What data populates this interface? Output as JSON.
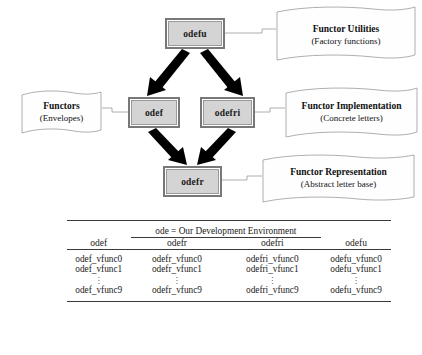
{
  "diagram": {
    "nodes": [
      {
        "id": "odefu",
        "label": "odefu"
      },
      {
        "id": "odef",
        "label": "odef"
      },
      {
        "id": "odefri",
        "label": "odefri"
      },
      {
        "id": "odefr",
        "label": "odefr"
      }
    ],
    "edges": [
      {
        "from": "odefu",
        "to": "odef",
        "style": "thick-arrow"
      },
      {
        "from": "odefu",
        "to": "odefri",
        "style": "thick-arrow"
      },
      {
        "from": "odef",
        "to": "odefr",
        "style": "thick-arrow"
      },
      {
        "from": "odefri",
        "to": "odefr",
        "style": "thick-arrow"
      }
    ],
    "notes": [
      {
        "id": "note-utilities",
        "title": "Functor Utilities",
        "subtitle": "(Factory functions)",
        "attached_to": "odefu"
      },
      {
        "id": "note-functors",
        "title": "Functors",
        "subtitle": "(Envelopes)",
        "attached_to": "odef"
      },
      {
        "id": "note-implementation",
        "title": "Functor Implementation",
        "subtitle": "(Concrete letters)",
        "attached_to": "odefri"
      },
      {
        "id": "note-representation",
        "title": "Functor Representation",
        "subtitle": "(Abstract letter base)",
        "attached_to": "odefr"
      }
    ],
    "colors": {
      "node_fill": "#d4d4d4",
      "node_border": "#787878",
      "arrow": "#000000",
      "connector": "#9a9a9a",
      "note_border": "#9a9a9a"
    }
  },
  "table": {
    "span_header": "ode = Our Development Environment",
    "columns": [
      "odef",
      "odefr",
      "odefri",
      "odefu"
    ],
    "rows": [
      [
        "odef_vfunc0",
        "odefr_vfunc0",
        "odefri_vfunc0",
        "odefu_vfunc0"
      ],
      [
        "odef_vfunc1",
        "odefr_vfunc1",
        "odefri_vfunc1",
        "odefu_vfunc1"
      ]
    ],
    "ellipsis": "vertical-dots",
    "last_row": [
      "odef_vfunc9",
      "odefr_vfunc9",
      "odefri_vfunc9",
      "odefu_vfunc9"
    ]
  }
}
